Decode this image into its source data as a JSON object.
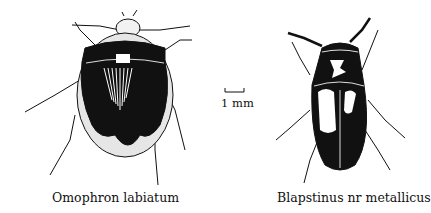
{
  "figure": {
    "specimens": [
      {
        "name": "Omophron labiatum",
        "position": "left"
      },
      {
        "name": "Blapstinus nr metallicus",
        "position": "right"
      }
    ],
    "scale_bar": {
      "label": "1 mm"
    },
    "colors": {
      "ink": "#111111",
      "background": "#ffffff",
      "stipple": "#e6e6e6"
    }
  }
}
